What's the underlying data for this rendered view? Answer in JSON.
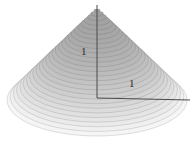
{
  "chart_data": {
    "type": "surface",
    "surface_shape": "cone",
    "equation": "z = 1 - sqrt(x^2 + y^2)",
    "height": 1,
    "base_radius": 1,
    "xlim": [
      -1,
      1
    ],
    "ylim": [
      -1,
      1
    ],
    "zlim": [
      0,
      1
    ],
    "title": "",
    "legend": "none",
    "grid": "horizontal contour rings",
    "rings": 28,
    "labels": {
      "height": "1",
      "radius": "1"
    },
    "colors": {
      "background": "#ffffff",
      "surface_dark": "#a0a0a0",
      "surface_light": "#f5f5f5",
      "ring_line": "rgba(70,70,70,0.28)",
      "axis": "#4a4a4a",
      "label": "#2b2b2b"
    },
    "geometry": {
      "apex": [
        97,
        7
      ],
      "base_center": [
        97,
        100
      ],
      "base_rx": 90,
      "base_ry": 36,
      "axis_top": [
        97,
        5
      ],
      "axis_corner": [
        97,
        98
      ],
      "r_axis_end": [
        190,
        100
      ],
      "shade_min_gray": 160,
      "shade_range": 85,
      "shade_exponent": 1.8
    }
  }
}
